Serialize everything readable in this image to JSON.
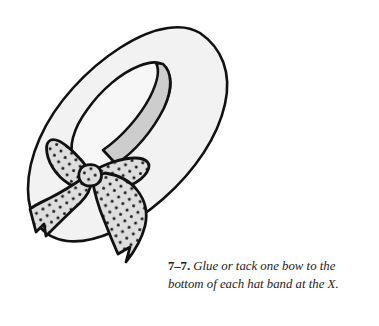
{
  "page": {
    "background_color": "#ffffff",
    "width": 379,
    "height": 326
  },
  "figure": {
    "name": "hat-with-polka-dot-bow-illustration",
    "style": "black-and-white line drawing with flat gray fills",
    "colors": {
      "outline": "#111111",
      "brim_fill": "#f2f2f2",
      "crown_fill": "#f7f7f7",
      "band_fill": "#cdcdcd",
      "bow_fill": "#dedede",
      "dot_color": "#1a1a1a",
      "background": "#ffffff"
    },
    "parts": [
      {
        "name": "hat-brim",
        "fill": "#f2f2f2",
        "description": "large tilted ellipse forming the outer brim"
      },
      {
        "name": "hat-crown",
        "fill": "#f7f7f7",
        "description": "inner oval crown rising from the brim"
      },
      {
        "name": "hat-band",
        "fill": "#cdcdcd",
        "description": "gray ribbon band wrapping the crown from upper right down to the bow"
      },
      {
        "name": "bow-loop-upper-left",
        "fill": "#dedede",
        "description": "teardrop loop of the bow pointing up and left"
      },
      {
        "name": "bow-loop-right",
        "fill": "#dedede",
        "description": "teardrop loop of the bow pointing right"
      },
      {
        "name": "bow-tail-left",
        "fill": "#dedede",
        "description": "ribbon tail folding down to the left with a notched end"
      },
      {
        "name": "bow-tail-right",
        "fill": "#dedede",
        "description": "longer ribbon tail sweeping down with a notched end"
      },
      {
        "name": "bow-knot",
        "fill": "#dedede",
        "description": "center knot where the loops and tails converge"
      }
    ]
  },
  "caption": {
    "number": "7–7.",
    "text": "Glue or tack one bow to the bottom of each hat band at the X."
  }
}
